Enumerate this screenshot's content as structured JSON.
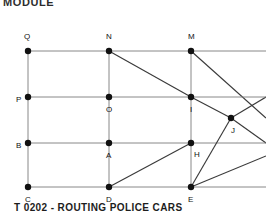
{
  "header": {
    "text": "MODULE"
  },
  "caption": {
    "text": "T 0202 - ROUTING POLICE CARS"
  },
  "figure": {
    "background": "#ffffff",
    "line_color": "#3a3a3a",
    "grid_line_color": "#7a7a7a",
    "node_color": "#111111",
    "label_color": "#111111",
    "node_radius": 3.2,
    "viewbox": {
      "width": 266,
      "height": 186
    },
    "nodes": [
      {
        "id": "Q",
        "label": "Q",
        "x": 28,
        "y": 37,
        "label_dx": -4,
        "label_dy": -14
      },
      {
        "id": "N",
        "label": "N",
        "x": 109,
        "y": 37,
        "label_dx": -3,
        "label_dy": -14
      },
      {
        "id": "M",
        "label": "M",
        "x": 191,
        "y": 37,
        "label_dx": -3,
        "label_dy": -14
      },
      {
        "id": "P",
        "label": "P",
        "x": 28,
        "y": 83,
        "label_dx": -12,
        "label_dy": 3
      },
      {
        "id": "O",
        "label": "O",
        "x": 109,
        "y": 83,
        "label_dx": -3,
        "label_dy": 13
      },
      {
        "id": "I",
        "label": "I",
        "x": 191,
        "y": 83,
        "label_dx": -1,
        "label_dy": 13
      },
      {
        "id": "B",
        "label": "B",
        "x": 28,
        "y": 129,
        "label_dx": -12,
        "label_dy": 3
      },
      {
        "id": "A",
        "label": "A",
        "x": 109,
        "y": 129,
        "label_dx": -3,
        "label_dy": 13
      },
      {
        "id": "H",
        "label": "H",
        "x": 191,
        "y": 129,
        "label_dx": 3,
        "label_dy": 12
      },
      {
        "id": "C",
        "label": "C",
        "x": 28,
        "y": 173,
        "label_dx": -3,
        "label_dy": 13
      },
      {
        "id": "D",
        "label": "D",
        "x": 109,
        "y": 173,
        "label_dx": -3,
        "label_dy": 13
      },
      {
        "id": "E",
        "label": "E",
        "x": 191,
        "y": 173,
        "label_dx": -3,
        "label_dy": 13
      },
      {
        "id": "J",
        "label": "J",
        "x": 231,
        "y": 104,
        "label_dx": 0,
        "label_dy": 13
      }
    ],
    "grid_edges": [
      {
        "from": "Q",
        "to": "N",
        "kind": "horizontal"
      },
      {
        "from": "N",
        "to": "M",
        "kind": "horizontal"
      },
      {
        "from": "P",
        "to": "O",
        "kind": "horizontal"
      },
      {
        "from": "O",
        "to": "I",
        "kind": "horizontal"
      },
      {
        "from": "B",
        "to": "A",
        "kind": "horizontal"
      },
      {
        "from": "A",
        "to": "H",
        "kind": "horizontal"
      },
      {
        "from": "C",
        "to": "D",
        "kind": "horizontal"
      },
      {
        "from": "D",
        "to": "E",
        "kind": "horizontal"
      },
      {
        "from": "Q",
        "to": "P",
        "kind": "vertical"
      },
      {
        "from": "P",
        "to": "B",
        "kind": "vertical"
      },
      {
        "from": "B",
        "to": "C",
        "kind": "vertical"
      },
      {
        "from": "N",
        "to": "O",
        "kind": "vertical"
      },
      {
        "from": "O",
        "to": "A",
        "kind": "vertical"
      },
      {
        "from": "A",
        "to": "D",
        "kind": "vertical"
      },
      {
        "from": "M",
        "to": "I",
        "kind": "vertical"
      },
      {
        "from": "I",
        "to": "H",
        "kind": "vertical"
      },
      {
        "from": "H",
        "to": "E",
        "kind": "vertical"
      }
    ],
    "diagonal_edges": [
      {
        "from": "N",
        "to": "I",
        "kind": "diagonal"
      },
      {
        "from": "D",
        "to": "H",
        "kind": "diagonal"
      },
      {
        "from": "I",
        "to": "J",
        "kind": "diagonal"
      },
      {
        "from": "E",
        "to": "J",
        "kind": "diagonal"
      }
    ],
    "open_edges": [
      {
        "from": "M",
        "x2": 266,
        "y2": 104,
        "note": "M toward right edge through J region"
      },
      {
        "from": "J",
        "x2": 266,
        "y2": 83,
        "note": "J up-right to edge"
      },
      {
        "from": "J",
        "x2": 266,
        "y2": 129,
        "note": "J down-right to edge"
      },
      {
        "from": "E",
        "x2": 266,
        "y2": 142,
        "note": "E up-right to edge"
      },
      {
        "from": "M",
        "x2": 266,
        "y2": 37,
        "note": "top row continues right"
      },
      {
        "from": "I",
        "x2": 266,
        "y2": 83,
        "note": "middle-upper row continues right"
      },
      {
        "from": "H",
        "x2": 266,
        "y2": 129,
        "note": "middle-lower row continues right"
      },
      {
        "from": "E",
        "x2": 266,
        "y2": 173,
        "note": "bottom row continues right"
      }
    ]
  }
}
